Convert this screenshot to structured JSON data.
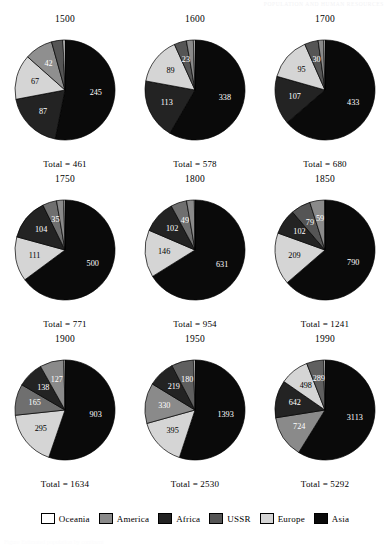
{
  "header": {
    "running_head": "POPULATION AND HUMAN RESOURCES"
  },
  "caption": {
    "text": "Figure   Estimated population by continent"
  },
  "legend": {
    "position": "bottom",
    "items": [
      {
        "label": "Oceania",
        "color": "#ffffff"
      },
      {
        "label": "America",
        "color": "#8a8a8a"
      },
      {
        "label": "Africa",
        "color": "#232323"
      },
      {
        "label": "USSR",
        "color": "#555555"
      },
      {
        "label": "Europe",
        "color": "#d5d5d5"
      },
      {
        "label": "Asia",
        "color": "#0a0a0a"
      }
    ]
  },
  "total_prefix": "Total = ",
  "chart_data": {
    "type": "pie",
    "title": "",
    "xlabel": "",
    "ylabel": "",
    "grid": false,
    "legend_position": "bottom",
    "series_names": [
      "Oceania",
      "America",
      "Africa",
      "USSR",
      "Europe",
      "Asia"
    ],
    "series_colors": [
      "#ffffff",
      "#8a8a8a",
      "#232323",
      "#555555",
      "#d5d5d5",
      "#0a0a0a"
    ],
    "units": "millions",
    "panels": [
      {
        "year": "1500",
        "total": 461,
        "total_label": "Total = 461",
        "slices": [
          {
            "name": "Asia",
            "value": 245,
            "label": "245",
            "color": "#0a0a0a",
            "label_fill": "light"
          },
          {
            "name": "Africa",
            "value": 87,
            "label": "87",
            "color": "#232323",
            "label_fill": "light"
          },
          {
            "name": "Europe",
            "value": 67,
            "label": "67",
            "color": "#d5d5d5",
            "label_fill": "dark"
          },
          {
            "name": "USSR",
            "value": 42,
            "label": "42",
            "color": "#8f8f8f",
            "label_fill": "light"
          },
          {
            "name": "America",
            "value": 17,
            "label": "17",
            "color": "#555555",
            "label_fill": "outside"
          },
          {
            "name": "Oceania",
            "value": 3,
            "label": "3",
            "color": "#ffffff",
            "label_fill": "outside"
          }
        ]
      },
      {
        "year": "1600",
        "total": 578,
        "total_label": "Total = 578",
        "slices": [
          {
            "name": "Asia",
            "value": 338,
            "label": "338",
            "color": "#0a0a0a",
            "label_fill": "light"
          },
          {
            "name": "Africa",
            "value": 113,
            "label": "113",
            "color": "#232323",
            "label_fill": "light"
          },
          {
            "name": "Europe",
            "value": 89,
            "label": "89",
            "color": "#d5d5d5",
            "label_fill": "dark"
          },
          {
            "name": "USSR",
            "value": 23,
            "label": "23",
            "color": "#555555",
            "label_fill": "light"
          },
          {
            "name": "America",
            "value": 13,
            "label": "13",
            "color": "#8a8a8a",
            "label_fill": "outside"
          },
          {
            "name": "Oceania",
            "value": 3,
            "label": "3",
            "color": "#ffffff",
            "label_fill": "outside"
          }
        ]
      },
      {
        "year": "1700",
        "total": 680,
        "total_label": "Total = 680",
        "slices": [
          {
            "name": "Asia",
            "value": 433,
            "label": "433",
            "color": "#0a0a0a",
            "label_fill": "light"
          },
          {
            "name": "Africa",
            "value": 107,
            "label": "107",
            "color": "#232323",
            "label_fill": "light"
          },
          {
            "name": "Europe",
            "value": 95,
            "label": "95",
            "color": "#d5d5d5",
            "label_fill": "dark"
          },
          {
            "name": "USSR",
            "value": 30,
            "label": "30",
            "color": "#555555",
            "label_fill": "light"
          },
          {
            "name": "America",
            "value": 12,
            "label": "12",
            "color": "#8a8a8a",
            "label_fill": "outside"
          },
          {
            "name": "Oceania",
            "value": 3,
            "label": "3",
            "color": "#ffffff",
            "label_fill": "outside"
          }
        ]
      },
      {
        "year": "1750",
        "total": 771,
        "total_label": "Total = 771",
        "slices": [
          {
            "name": "Asia",
            "value": 500,
            "label": "500",
            "color": "#0a0a0a",
            "label_fill": "light"
          },
          {
            "name": "Europe",
            "value": 111,
            "label": "111",
            "color": "#d5d5d5",
            "label_fill": "dark"
          },
          {
            "name": "Africa",
            "value": 104,
            "label": "104",
            "color": "#232323",
            "label_fill": "light"
          },
          {
            "name": "USSR",
            "value": 35,
            "label": "35",
            "color": "#6f6f6f",
            "label_fill": "light"
          },
          {
            "name": "America",
            "value": 18,
            "label": "18",
            "color": "#8a8a8a",
            "label_fill": "outside"
          },
          {
            "name": "Oceania",
            "value": 3,
            "label": "3",
            "color": "#ffffff",
            "label_fill": "outside"
          }
        ]
      },
      {
        "year": "1800",
        "total": 954,
        "total_label": "Total = 954",
        "slices": [
          {
            "name": "Asia",
            "value": 631,
            "label": "631",
            "color": "#0a0a0a",
            "label_fill": "light"
          },
          {
            "name": "Europe",
            "value": 146,
            "label": "146",
            "color": "#d5d5d5",
            "label_fill": "dark"
          },
          {
            "name": "Africa",
            "value": 102,
            "label": "102",
            "color": "#232323",
            "label_fill": "light"
          },
          {
            "name": "USSR",
            "value": 49,
            "label": "49",
            "color": "#6f6f6f",
            "label_fill": "light"
          },
          {
            "name": "America",
            "value": 24,
            "label": "24",
            "color": "#8a8a8a",
            "label_fill": "outside"
          },
          {
            "name": "Oceania",
            "value": 2,
            "label": "2",
            "color": "#ffffff",
            "label_fill": "outside"
          }
        ]
      },
      {
        "year": "1850",
        "total": 1241,
        "total_label": "Total = 1241",
        "slices": [
          {
            "name": "Asia",
            "value": 790,
            "label": "790",
            "color": "#0a0a0a",
            "label_fill": "light"
          },
          {
            "name": "Europe",
            "value": 209,
            "label": "209",
            "color": "#d5d5d5",
            "label_fill": "dark"
          },
          {
            "name": "Africa",
            "value": 102,
            "label": "102",
            "color": "#232323",
            "label_fill": "light"
          },
          {
            "name": "USSR",
            "value": 79,
            "label": "79",
            "color": "#555555",
            "label_fill": "light"
          },
          {
            "name": "America",
            "value": 59,
            "label": "59",
            "color": "#8a8a8a",
            "label_fill": "light"
          },
          {
            "name": "Oceania",
            "value": 2,
            "label": "2",
            "color": "#ffffff",
            "label_fill": "outside"
          }
        ]
      },
      {
        "year": "1900",
        "total": 1634,
        "total_label": "Total = 1634",
        "slices": [
          {
            "name": "Asia",
            "value": 903,
            "label": "903",
            "color": "#0a0a0a",
            "label_fill": "light"
          },
          {
            "name": "Europe",
            "value": 295,
            "label": "295",
            "color": "#d5d5d5",
            "label_fill": "dark"
          },
          {
            "name": "USSR",
            "value": 165,
            "label": "165",
            "color": "#6f6f6f",
            "label_fill": "light"
          },
          {
            "name": "Africa",
            "value": 138,
            "label": "138",
            "color": "#232323",
            "label_fill": "light"
          },
          {
            "name": "America",
            "value": 127,
            "label": "127",
            "color": "#8a8a8a",
            "label_fill": "light"
          },
          {
            "name": "Oceania",
            "value": 6,
            "label": "6",
            "color": "#ffffff",
            "label_fill": "outside"
          }
        ]
      },
      {
        "year": "1950",
        "total": 2530,
        "total_label": "Total = 2530",
        "slices": [
          {
            "name": "Asia",
            "value": 1393,
            "label": "1393",
            "color": "#0a0a0a",
            "label_fill": "light"
          },
          {
            "name": "Europe",
            "value": 395,
            "label": "395",
            "color": "#d5d5d5",
            "label_fill": "dark"
          },
          {
            "name": "USSR",
            "value": 330,
            "label": "330",
            "color": "#8a8a8a",
            "label_fill": "light"
          },
          {
            "name": "Africa",
            "value": 219,
            "label": "219",
            "color": "#232323",
            "label_fill": "light"
          },
          {
            "name": "America",
            "value": 180,
            "label": "180",
            "color": "#5f5f5f",
            "label_fill": "light"
          },
          {
            "name": "Oceania",
            "value": 13,
            "label": "13",
            "color": "#ffffff",
            "label_fill": "outside"
          }
        ]
      },
      {
        "year": "1990",
        "total": 5292,
        "total_label": "Total = 5292",
        "slices": [
          {
            "name": "Asia",
            "value": 3113,
            "label": "3113",
            "color": "#0a0a0a",
            "label_fill": "light"
          },
          {
            "name": "Europe",
            "value": 724,
            "label": "724",
            "color": "#8a8a8a",
            "label_fill": "light"
          },
          {
            "name": "Africa",
            "value": 642,
            "label": "642",
            "color": "#232323",
            "label_fill": "light"
          },
          {
            "name": "USSR",
            "value": 498,
            "label": "498",
            "color": "#d5d5d5",
            "label_fill": "dark"
          },
          {
            "name": "America",
            "value": 289,
            "label": "289",
            "color": "#5f5f5f",
            "label_fill": "light"
          },
          {
            "name": "Oceania",
            "value": 26,
            "label": "26",
            "color": "#ffffff",
            "label_fill": "outside"
          }
        ]
      }
    ]
  }
}
